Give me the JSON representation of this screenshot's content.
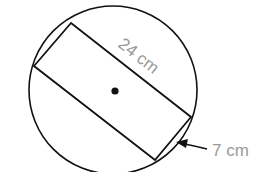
{
  "diagram": {
    "labels": {
      "long_side": "24 cm",
      "short_side": "7 cm"
    },
    "colors": {
      "stroke": "#111111",
      "label": "#9a9a9a",
      "background": "#ffffff"
    }
  }
}
